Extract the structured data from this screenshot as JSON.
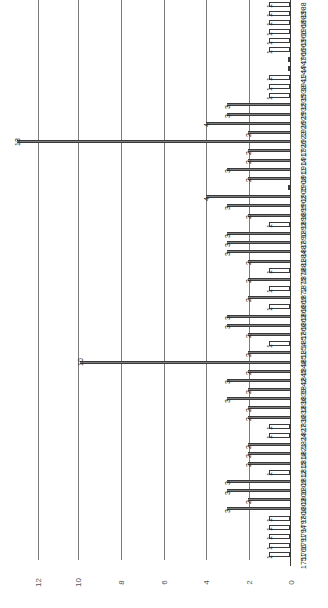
{
  "chart_data": {
    "type": "bar",
    "orientation": "horizontal-rotated-90",
    "title": "",
    "xlabel": "",
    "ylabel": "",
    "xlim": [
      0,
      12
    ],
    "xticks": [
      0,
      2,
      4,
      6,
      8,
      10,
      12
    ],
    "grid": true,
    "legend": null,
    "categories": [
      "1988",
      "1983",
      "1968",
      "1966",
      "1963",
      "1960",
      "1947",
      "1944",
      "1941",
      "1938",
      "1935",
      "1932",
      "1929",
      "1926",
      "1923",
      "1920",
      "1917",
      "1914",
      "1911",
      "1908",
      "1905",
      "1902",
      "1899",
      "1896",
      "1893",
      "1890",
      "1887",
      "1884",
      "1881",
      "1878",
      "1875",
      "1872",
      "1869",
      "1866",
      "1863",
      "1860",
      "1857",
      "1854",
      "1851",
      "1848",
      "1845",
      "1842",
      "1839",
      "1836",
      "1833",
      "1830",
      "1827",
      "1824",
      "1821",
      "1818",
      "1815",
      "1812",
      "1809",
      "1806",
      "1803",
      "1800",
      "1797",
      "1794",
      "1791",
      "1766",
      "1751"
    ],
    "values": [
      1,
      1,
      1,
      1,
      1,
      1,
      0,
      0,
      1,
      1,
      1,
      3,
      3,
      4,
      2,
      13,
      2,
      2,
      3,
      2,
      0,
      4,
      3,
      2,
      1,
      3,
      3,
      3,
      2,
      1,
      2,
      1,
      2,
      1,
      3,
      3,
      2,
      1,
      2,
      10,
      2,
      3,
      2,
      3,
      2,
      2,
      1,
      1,
      2,
      2,
      2,
      1,
      3,
      3,
      2,
      3,
      1,
      1,
      1,
      1,
      1
    ],
    "bar_value_labels": [
      "1",
      "1",
      "1",
      "1",
      "1",
      "1",
      "",
      "",
      "1",
      "1",
      "1",
      "3",
      "3",
      "4",
      "2",
      "13",
      "2",
      "2",
      "3",
      "2",
      "",
      "4",
      "3",
      "2",
      "1",
      "3",
      "3",
      "3",
      "2",
      "1",
      "2",
      "1",
      "2",
      "1",
      "3",
      "3",
      "2",
      "1",
      "2",
      "10",
      "2",
      "3",
      "2",
      "3",
      "2",
      "2",
      "1",
      "1",
      "2",
      "2",
      "2",
      "1",
      "3",
      "3",
      "2",
      "3",
      "1",
      "1",
      "1",
      "1",
      "1"
    ],
    "annotations": [
      {
        "label": "13",
        "category": "1929"
      },
      {
        "label": "10",
        "category": "1878"
      }
    ]
  },
  "axis": {
    "tick_labels": [
      "12",
      "10",
      "8",
      "6",
      "4",
      "2",
      "0"
    ]
  }
}
